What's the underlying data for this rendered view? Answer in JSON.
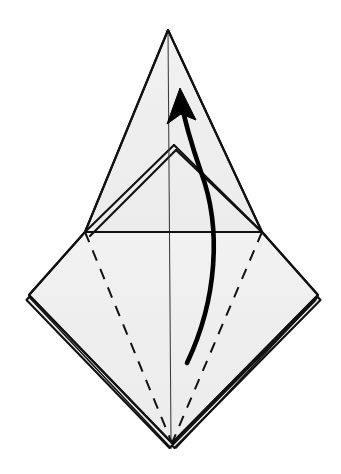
{
  "document": {
    "type": "origami-folding-diagram",
    "title": "Origami fold step diagram",
    "description": "Kite/diamond shaped folded paper seen from the front with an upper pointed flap, a horizontal valley-fold reference line and a curved arrow indicating the front flap is lifted upward."
  },
  "canvas": {
    "width": 341,
    "height": 474,
    "background_color": "#ffffff"
  },
  "style": {
    "paper_fill": "#efefef",
    "paper_texture_speckle": "#d8d8d8",
    "outline_color": "#111111",
    "crease_color": "#3a3a3a",
    "hidden_edge_color": "#111111",
    "arrow_color": "#000000",
    "outline_width": 2.1,
    "crease_width": 1.05,
    "dash_pattern": "11 9",
    "arrow_width": 4.6
  },
  "geometry": {
    "points": {
      "top_apex": [
        168,
        30
      ],
      "left_vertex": [
        29,
        295
      ],
      "right_vertex": [
        318,
        295
      ],
      "bottom_vertex": [
        172,
        443
      ],
      "left_junction": [
        85,
        232
      ],
      "right_junction": [
        262,
        232
      ],
      "inner_peak": [
        174,
        145
      ]
    },
    "paths": {
      "upper_flap_outline": "M168,30 L85,232 L262,232 Z",
      "lower_diamond_outline": "M85,232 L29,295 L172,443 L318,295 L262,232 Z",
      "inner_flap_left": "M174,145 L85,232",
      "inner_flap_right": "M174,145 L262,232",
      "inner_flap_left_under": "M176,150 L90,236",
      "inner_flap_right_under": "M176,150 L266,236",
      "center_crease": "M168,30 L171,443",
      "horizontal_valley_dashed": "M85,232 L262,232",
      "hidden_diagonal_left": "M85,232 L172,443",
      "hidden_diagonal_right": "M262,232 L172,443",
      "under_layer_left": "M29,297 L171,448",
      "under_layer_right": "M318,297 L176,448",
      "arrow_curve": "M187,363 C217,300 222,228 201,172 C192,146 184,118 180,97",
      "arrow_head": "M180,88 L196,120 L181,114 L167,124 Z"
    }
  },
  "annotations": {
    "fold_instruction": "lift front flap upward",
    "arrow_direction": "up",
    "line_legend": {
      "solid": "paper edge",
      "dashed": "hidden / fold line",
      "thin_solid": "existing crease",
      "thick_curved_arrow": "fold in direction of arrow"
    }
  }
}
